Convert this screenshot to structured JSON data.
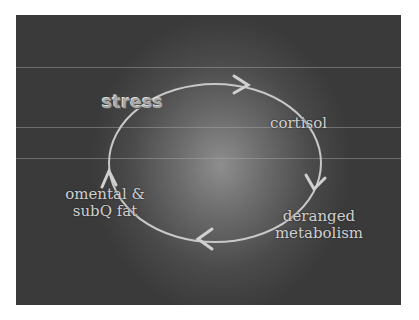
{
  "diagram": {
    "type": "cycle",
    "nodes": [
      {
        "id": "stress",
        "label": "stress"
      },
      {
        "id": "cortisol",
        "label": "cortisol"
      },
      {
        "id": "metabolism",
        "label_line1": "deranged",
        "label_line2": "metabolism"
      },
      {
        "id": "fat",
        "label_line1": "omental &",
        "label_line2": "subQ fat"
      }
    ],
    "edges": [
      {
        "from": "stress",
        "to": "cortisol"
      },
      {
        "from": "cortisol",
        "to": "metabolism"
      },
      {
        "from": "metabolism",
        "to": "fat"
      },
      {
        "from": "fat",
        "to": "stress"
      }
    ],
    "colors": {
      "background": "#4a4a4a",
      "arrow": "#c8c8c8",
      "text": "#cfcfcf"
    }
  }
}
